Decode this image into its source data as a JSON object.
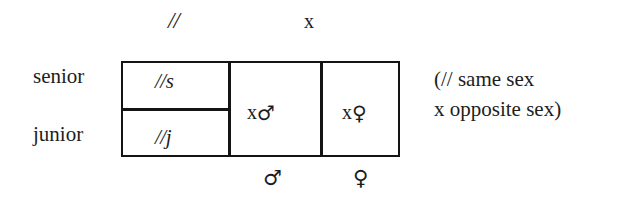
{
  "figure": {
    "type": "kinship-category-table",
    "headers": {
      "same_sex_symbol": "//",
      "opposite_sex_symbol": "x"
    },
    "row_labels": {
      "senior": "senior",
      "junior": "junior"
    },
    "cells": {
      "same_sex_senior": "//s",
      "same_sex_junior": "//j",
      "opposite_sex_male": "x",
      "opposite_sex_male_symbol": "♂",
      "opposite_sex_female": "x",
      "opposite_sex_female_symbol": "♀"
    },
    "column_footers": {
      "male_symbol": "♂",
      "female_symbol": "♀"
    },
    "legend": {
      "line1": "(// same sex",
      "line2": "x opposite sex)"
    },
    "colors": {
      "background": "#ffffff",
      "ink": "#1d1d1d",
      "rule": "#141414"
    }
  }
}
